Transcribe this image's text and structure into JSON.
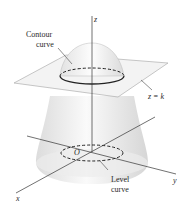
{
  "diagram": {
    "type": "3d-surface-contour-illustration",
    "labels": {
      "contour_line1": "Contour",
      "contour_line2": "curve",
      "plane": "z = k",
      "level_line1": "Level",
      "level_line2": "curve",
      "axis_z": "z",
      "axis_x": "x",
      "axis_y": "y",
      "origin": "O"
    },
    "colors": {
      "stroke": "#333333",
      "surface_fill": "#ececec",
      "plane_fill": "#f2f2f2",
      "label": "#2a2a2a"
    }
  }
}
